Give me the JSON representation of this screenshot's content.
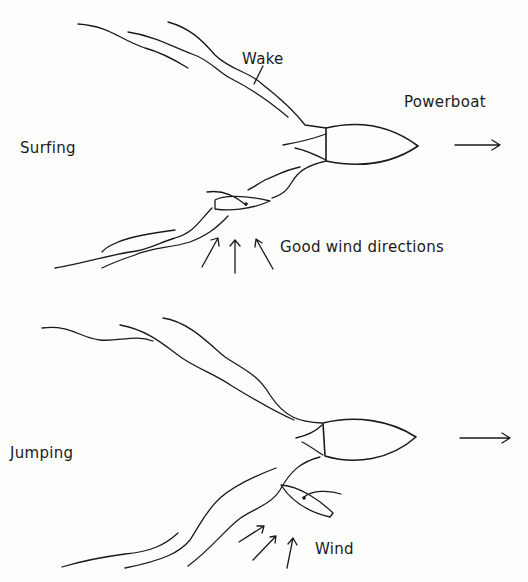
{
  "diagram": {
    "panels": [
      {
        "id": "surfing",
        "title": "Surfing",
        "labels": {
          "wake": "Wake",
          "powerboat": "Powerboat",
          "wind": "Good wind directions"
        }
      },
      {
        "id": "jumping",
        "title": "Jumping",
        "labels": {
          "wind": "Wind"
        }
      }
    ],
    "colors": {
      "ink": "#1a1a1a",
      "paper": "#fdfdfc"
    }
  }
}
